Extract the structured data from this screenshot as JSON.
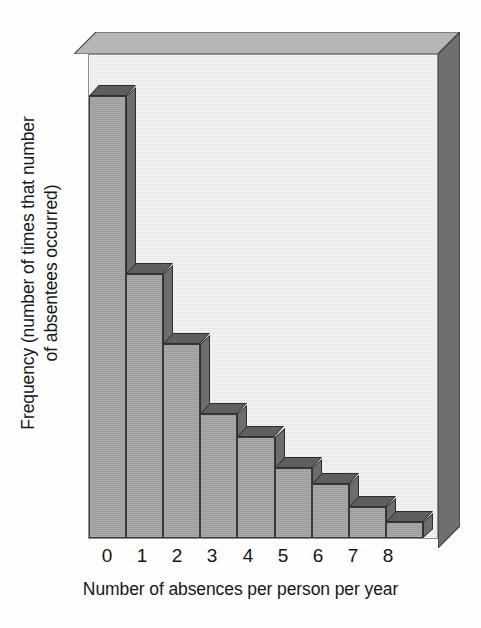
{
  "chart_data": {
    "type": "bar",
    "title": "",
    "subtitle": "",
    "xlabel": "Number of absences per person per year",
    "ylabel": "Frequency (number of times that number of absentees occurred)",
    "ylabel_lines": [
      "Frequency (number of times that number",
      "of absentees occurred)"
    ],
    "categories": [
      "0",
      "1",
      "2",
      "3",
      "4",
      "5",
      "6",
      "7",
      "8"
    ],
    "values": [
      57,
      34,
      25,
      16,
      13,
      9,
      7,
      4,
      2
    ],
    "ylim": [
      0,
      60
    ],
    "xlim": [
      0,
      9
    ],
    "grid": false,
    "legend": null,
    "tick_labels_x": [
      "0",
      "1",
      "2",
      "3",
      "4",
      "5",
      "6",
      "7",
      "8"
    ],
    "tick_labels_y": [],
    "style": "3d-histogram",
    "annotations": []
  },
  "colors": {
    "plot_background": "#e2e2e2",
    "box_top_face": "#b6b6b6",
    "box_right_face": "#6f6f6f",
    "bar_front": "#9b9b9b",
    "bar_top": "#5f5f5f",
    "bar_side": "#6d6d6d",
    "outline": "#3a3a3a",
    "text": "#161616",
    "page_background": "#fefefe"
  },
  "figure": {
    "x_axis_title": "Number of absences per person per year",
    "y_axis_title_line1": "Frequency (number of times that number",
    "y_axis_title_line2": "of absentees occurred)"
  }
}
